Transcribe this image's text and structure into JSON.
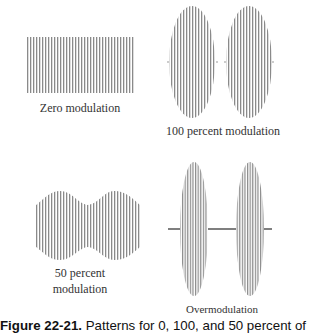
{
  "figure": {
    "panels": [
      {
        "id": "zero",
        "label": "Zero modulation"
      },
      {
        "id": "hundred",
        "label": "100 percent modulation"
      },
      {
        "id": "fifty",
        "label_line1": "50 percent",
        "label_line2": "modulation"
      },
      {
        "id": "over",
        "label": "Overmodulation"
      }
    ],
    "caption": {
      "number": "Figure 22-21.",
      "text": " Patterns for 0, 100, and 50 percent of"
    },
    "colors": {
      "line": "#8a8a8a",
      "axis": "#555555"
    }
  }
}
